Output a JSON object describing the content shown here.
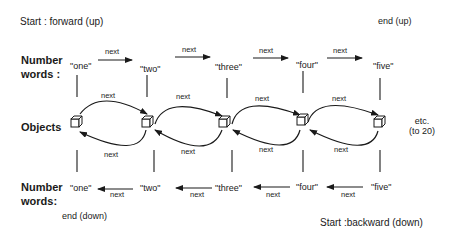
{
  "captions": {
    "start_forward": "Start : forward (up)",
    "end_up": "end  (up)",
    "end_down": "end (down)",
    "start_backward": "Start :backward (down)"
  },
  "row_labels": {
    "top_line1": "Number",
    "top_line2": "words :",
    "objects": "Objects",
    "bottom_line1": "Number",
    "bottom_line2": "words:"
  },
  "top_words": [
    "\"one\"",
    "\"two\"",
    "\"three\"",
    "\"four\"",
    "\"five\""
  ],
  "bottom_words": [
    "\"one\"",
    "\"two\"",
    "\"three\"",
    "\"four\"",
    "\"five\""
  ],
  "link_label": "next",
  "continuation": {
    "line1": "etc.",
    "line2": "(to 20)"
  },
  "colors": {
    "ink": "#1a1a1a",
    "background": "#ffffff"
  }
}
